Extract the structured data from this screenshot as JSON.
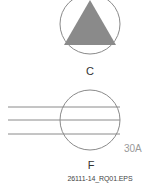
{
  "figure": {
    "symbol_c": {
      "label": "C",
      "circle": {
        "cx": 90,
        "cy": 24,
        "r": 30,
        "stroke": "#8a8a8a"
      },
      "triangle": {
        "points": "90,0 64,45 116,45",
        "fill": "#8a8a8a"
      }
    },
    "symbol_f": {
      "label": "F",
      "angle_label": "30A",
      "circle": {
        "cx": 90,
        "cy": 120,
        "r": 30,
        "stroke": "#8a8a8a"
      },
      "lines_y": [
        107,
        120,
        134
      ],
      "lines_x": [
        8,
        120
      ]
    },
    "file_id": "26111-14_RQ01.EPS"
  },
  "colors": {
    "stroke": "#8a8a8a",
    "fill": "#8a8a8a",
    "text": "#333333",
    "angle_text": "#999999"
  }
}
